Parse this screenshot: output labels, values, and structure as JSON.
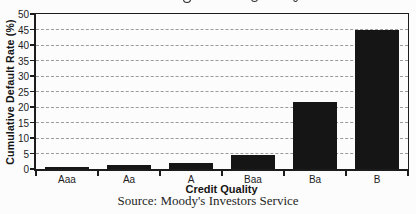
{
  "chart_data": {
    "type": "bar",
    "title": "",
    "title_clipped": true,
    "categories": [
      "Aaa",
      "Aa",
      "A",
      "Baa",
      "Ba",
      "B"
    ],
    "values": [
      0.8,
      1.3,
      2.1,
      4.5,
      21.5,
      45
    ],
    "xlabel": "Credit Quality",
    "ylabel": "Cumulative Default Rate (%)",
    "ylim": [
      0,
      50
    ],
    "yticks": [
      0,
      5,
      10,
      15,
      20,
      25,
      30,
      35,
      40,
      45,
      50
    ],
    "grid": "horizontal-dashed",
    "legend": "none",
    "bar_color": "#151515",
    "grid_color": "#9b9b9b",
    "axis_color": "#1c1c1c",
    "source": "Source: Moody's Investors Service"
  }
}
